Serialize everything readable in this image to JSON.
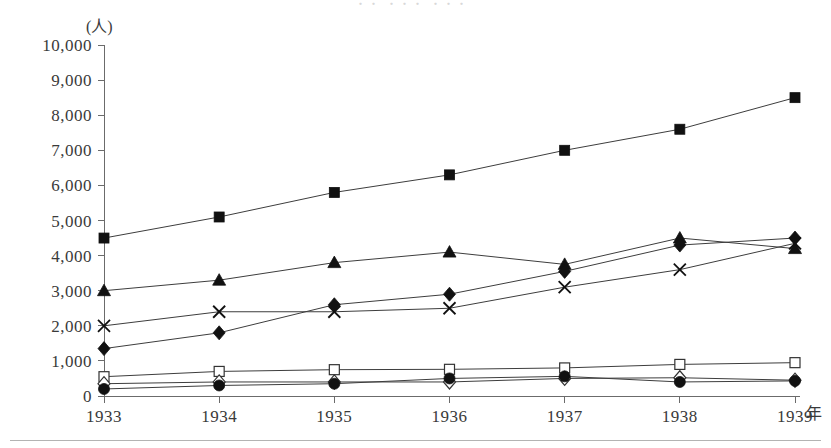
{
  "figure": {
    "clipped_top_text": "・・  ・・・  ・・・",
    "y_unit_label": "(人)",
    "x_unit_label": "年"
  },
  "chart_data": {
    "type": "line",
    "title": "",
    "xlabel": "年",
    "ylabel": "(人)",
    "x": [
      "1933",
      "1934",
      "1935",
      "1936",
      "1937",
      "1938",
      "1939"
    ],
    "categories": [
      "1933",
      "1934",
      "1935",
      "1936",
      "1937",
      "1938",
      "1939"
    ],
    "ylim": [
      0,
      10000
    ],
    "ytick_values": [
      0,
      1000,
      2000,
      3000,
      4000,
      5000,
      6000,
      7000,
      8000,
      9000,
      10000
    ],
    "ytick_labels": [
      "0",
      "1,000",
      "2,000",
      "3,000",
      "4,000",
      "5,000",
      "6,000",
      "7,000",
      "8,000",
      "9,000",
      "10,000"
    ],
    "grid": false,
    "legend": "none",
    "series": [
      {
        "name": "series-filled-square",
        "marker": "filled-square",
        "values": [
          4500,
          5100,
          5800,
          6300,
          7000,
          7600,
          8500
        ]
      },
      {
        "name": "series-filled-triangle",
        "marker": "filled-triangle",
        "values": [
          3000,
          3300,
          3800,
          4100,
          3750,
          4500,
          4200
        ]
      },
      {
        "name": "series-cross",
        "marker": "cross",
        "values": [
          2000,
          2400,
          2400,
          2500,
          3100,
          3600,
          4350
        ]
      },
      {
        "name": "series-filled-diamond",
        "marker": "filled-diamond",
        "values": [
          1350,
          1800,
          2600,
          2900,
          3550,
          4300,
          4500
        ]
      },
      {
        "name": "series-open-square",
        "marker": "open-square",
        "values": [
          550,
          700,
          750,
          760,
          800,
          900,
          950
        ]
      },
      {
        "name": "series-open-diamond",
        "marker": "open-diamond",
        "values": [
          350,
          400,
          400,
          400,
          500,
          520,
          450
        ]
      },
      {
        "name": "series-filled-circle",
        "marker": "filled-circle",
        "values": [
          200,
          300,
          350,
          500,
          560,
          400,
          430
        ]
      }
    ]
  }
}
